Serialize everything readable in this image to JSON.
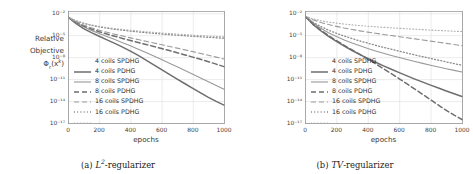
{
  "figure": {
    "panels": [
      {
        "id": "panel-a",
        "caption_label": "(a)",
        "caption_math": "L",
        "caption_exp": "2",
        "caption_rest": "-regularizer",
        "ylabel_line1": "Relative",
        "ylabel_line2": "Objective",
        "ylabel_line3_base": "Φ",
        "ylabel_line3_sub": "r",
        "ylabel_line3_arg": "(x",
        "ylabel_line3_sup": "k",
        "ylabel_line3_close": ")",
        "xlabel": "epochs"
      },
      {
        "id": "panel-b",
        "caption_label": "(b)",
        "caption_math": "TV",
        "caption_exp": "",
        "caption_rest": "-regularizer",
        "ylabel_line1": "",
        "ylabel_line2": "",
        "xlabel": "epochs"
      }
    ],
    "legend_entries": [
      {
        "label": "4 coils SPDHG",
        "style": "solid",
        "color": "#6e6e6e",
        "width": 1.5
      },
      {
        "label": "4 coils PDHG",
        "style": "solid",
        "color": "#9a9a9a",
        "width": 1.1
      },
      {
        "label": "8 coils SPDHG",
        "style": "dashed",
        "color": "#6e6e6e",
        "width": 1.5
      },
      {
        "label": "8 coils PDHG",
        "style": "dashed",
        "color": "#9a9a9a",
        "width": 1.1
      },
      {
        "label": "16 coils SPDHG",
        "style": "dotted",
        "color": "#8a8a8a",
        "width": 1.3
      },
      {
        "label": "16 coils PDHG",
        "style": "dotted",
        "color": "#b0b0b0",
        "width": 1.1
      }
    ],
    "colors": {
      "axis": "#8c8c8c",
      "grid": "#d9d9d9",
      "text": "#333333",
      "background": "#ffffff",
      "plot_background": "#ffffff"
    }
  },
  "chart_data": [
    {
      "type": "line",
      "panel": "a",
      "title": "",
      "xlabel": "epochs",
      "ylabel": "Relative Objective Φ_r(x^k)",
      "xlim": [
        0,
        1000
      ],
      "ylim": [
        1e-17,
        0.02
      ],
      "yscale": "log",
      "xticks": [
        0,
        200,
        400,
        600,
        800,
        1000
      ],
      "xticklabels": [
        "0",
        "200",
        "400",
        "600",
        "800",
        "1000"
      ],
      "yticks": [
        0.01,
        1e-05,
        1e-08,
        1e-11,
        1e-14,
        1e-17
      ],
      "yticklabels": [
        "10⁻²",
        "10⁻⁵",
        "10⁻⁸",
        "10⁻¹¹",
        "10⁻¹⁴",
        "10⁻¹⁷"
      ],
      "grid": true,
      "legend_position": "center-left",
      "x": [
        0,
        50,
        100,
        150,
        200,
        250,
        300,
        350,
        400,
        450,
        500,
        550,
        600,
        650,
        700,
        750,
        800,
        850,
        900,
        950,
        1000
      ],
      "series": [
        {
          "name": "4 coils SPDHG",
          "style": "solid",
          "values": [
            0.003,
            0.0004,
            8e-05,
            2.2e-05,
            7e-06,
            2.3e-06,
            7.5e-07,
            2.3e-07,
            6.5e-08,
            1.7e-08,
            4e-09,
            9e-10,
            2e-10,
            4.5e-11,
            1e-11,
            2.3e-12,
            5.5e-13,
            1.3e-13,
            3.2e-14,
            9e-15,
            2.8e-15
          ]
        },
        {
          "name": "4 coils PDHG",
          "style": "solid",
          "values": [
            0.003,
            0.00055,
            0.00014,
            4.5e-05,
            1.7e-05,
            6.5e-06,
            2.5e-06,
            9.5e-07,
            3.5e-07,
            1.2e-07,
            4.2e-08,
            1.4e-08,
            4.6e-09,
            1.5e-09,
            4.8e-10,
            1.5e-10,
            4.6e-11,
            1.4e-11,
            4.2e-12,
            1.3e-12,
            4e-13
          ]
        },
        {
          "name": "8 coils SPDHG",
          "style": "dashed",
          "values": [
            0.003,
            0.0006,
            0.00018,
            7e-05,
            3e-05,
            1.4e-05,
            7e-06,
            3.6e-06,
            1.9e-06,
            1e-06,
            5.4e-07,
            2.9e-07,
            1.5e-07,
            7.8e-08,
            4e-08,
            2e-08,
            1e-08,
            5e-09,
            2.4e-09,
            1.1e-09,
            5e-10
          ]
        },
        {
          "name": "8 coils PDHG",
          "style": "dashed",
          "values": [
            0.003,
            0.0007,
            0.00024,
            0.0001,
            4.8e-05,
            2.5e-05,
            1.35e-05,
            7.5e-06,
            4.3e-06,
            2.5e-06,
            1.45e-06,
            8.5e-07,
            5e-07,
            2.9e-07,
            1.7e-07,
            9.8e-08,
            5.6e-08,
            3.2e-08,
            1.8e-08,
            1e-08,
            5.5e-09
          ]
        },
        {
          "name": "16 coils SPDHG",
          "style": "dotted",
          "values": [
            0.003,
            0.0009,
            0.0004,
            0.00022,
            0.000135,
            9e-05,
            6.4e-05,
            4.7e-05,
            3.6e-05,
            2.8e-05,
            2.2e-05,
            1.8e-05,
            1.45e-05,
            1.2e-05,
            1e-05,
            8.4e-06,
            7.1e-06,
            6e-06,
            5.1e-06,
            4.4e-06,
            3.8e-06
          ]
        },
        {
          "name": "16 coils PDHG",
          "style": "dotted",
          "values": [
            0.003,
            0.00095,
            0.00044,
            0.00025,
            0.00016,
            0.00011,
            8e-05,
            6e-05,
            4.7e-05,
            3.7e-05,
            3e-05,
            2.45e-05,
            2e-05,
            1.7e-05,
            1.42e-05,
            1.2e-05,
            1.02e-05,
            8.8e-06,
            7.6e-06,
            6.6e-06,
            5.8e-06
          ]
        }
      ]
    },
    {
      "type": "line",
      "panel": "b",
      "title": "",
      "xlabel": "epochs",
      "ylabel": "Relative Objective Φ_r(x^k)",
      "xlim": [
        0,
        1000
      ],
      "ylim": [
        1e-17,
        0.02
      ],
      "yscale": "log",
      "xticks": [
        0,
        200,
        400,
        600,
        800,
        1000
      ],
      "xticklabels": [
        "0",
        "200",
        "400",
        "600",
        "800",
        "1000"
      ],
      "yticks": [
        0.01,
        1e-05,
        1e-08,
        1e-11,
        1e-14,
        1e-17
      ],
      "yticklabels": [
        "10⁻²",
        "10⁻⁵",
        "10⁻⁸",
        "10⁻¹¹",
        "10⁻¹⁴",
        "10⁻¹⁷"
      ],
      "grid": true,
      "legend_position": "center-left",
      "x": [
        0,
        50,
        100,
        150,
        200,
        250,
        300,
        350,
        400,
        450,
        500,
        550,
        600,
        650,
        700,
        750,
        800,
        850,
        900,
        950,
        1000
      ],
      "series": [
        {
          "name": "4 coils SPDHG",
          "style": "solid",
          "values": [
            0.004,
            0.0003,
            4e-05,
            7e-06,
            1.4e-06,
            3.2e-07,
            8e-08,
            2.2e-08,
            6.5e-09,
            2e-09,
            6.5e-10,
            2.2e-10,
            7.5e-11,
            2.7e-11,
            1e-11,
            3.8e-12,
            1.5e-12,
            6e-13,
            2.4e-13,
            1e-13,
            4.2e-14
          ]
        },
        {
          "name": "4 coils PDHG",
          "style": "solid",
          "values": [
            0.004,
            0.0005,
            9e-05,
            2.2e-05,
            6.5e-06,
            2.2e-06,
            8.5e-07,
            3.5e-07,
            1.5e-07,
            7e-08,
            3.4e-08,
            1.7e-08,
            8.8e-09,
            4.6e-09,
            2.5e-09,
            1.4e-09,
            7.8e-10,
            4.5e-10,
            2.6e-10,
            1.55e-10,
            9.2e-11
          ]
        },
        {
          "name": "8 coils SPDHG",
          "style": "dashed",
          "values": [
            0.004,
            0.00035,
            5e-05,
            9e-06,
            1.8e-06,
            4e-07,
            9.5e-08,
            2.3e-08,
            5.5e-09,
            1.2e-09,
            2.6e-10,
            5.5e-11,
            1.1e-11,
            2.2e-12,
            4.2e-13,
            8e-14,
            1.5e-14,
            2.8e-15,
            5.2e-16,
            1.2e-16,
            3e-17
          ]
        },
        {
          "name": "8 coils PDHG",
          "style": "dashed",
          "values": [
            0.004,
            0.0013,
            0.00055,
            0.00028,
            0.00016,
            9.5e-05,
            6e-05,
            3.9e-05,
            2.6e-05,
            1.8e-05,
            1.25e-05,
            8.8e-06,
            6.2e-06,
            4.4e-06,
            3.1e-06,
            2.2e-06,
            1.55e-06,
            1.1e-06,
            7.6e-07,
            5.3e-07,
            3.7e-07
          ]
        },
        {
          "name": "16 coils SPDHG",
          "style": "dotted",
          "values": [
            0.004,
            0.0006,
            0.00015,
            4.8e-05,
            1.8e-05,
            7.5e-06,
            3.4e-06,
            1.6e-06,
            8e-07,
            4.1e-07,
            2.2e-07,
            1.2e-07,
            6.5e-08,
            3.6e-08,
            2e-08,
            1.15e-08,
            6.6e-09,
            3.8e-09,
            2.2e-09,
            1.3e-09,
            7.8e-10
          ]
        },
        {
          "name": "16 coils PDHG",
          "style": "dotted",
          "values": [
            0.004,
            0.0017,
            0.00095,
            0.00062,
            0.00044,
            0.00033,
            0.000255,
            0.000205,
            0.000168,
            0.00014,
            0.000118,
            0.0001,
            8.6e-05,
            7.5e-05,
            6.5e-05,
            5.7e-05,
            5e-05,
            4.4e-05,
            3.9e-05,
            3.5e-05,
            3.1e-05
          ]
        }
      ]
    }
  ]
}
